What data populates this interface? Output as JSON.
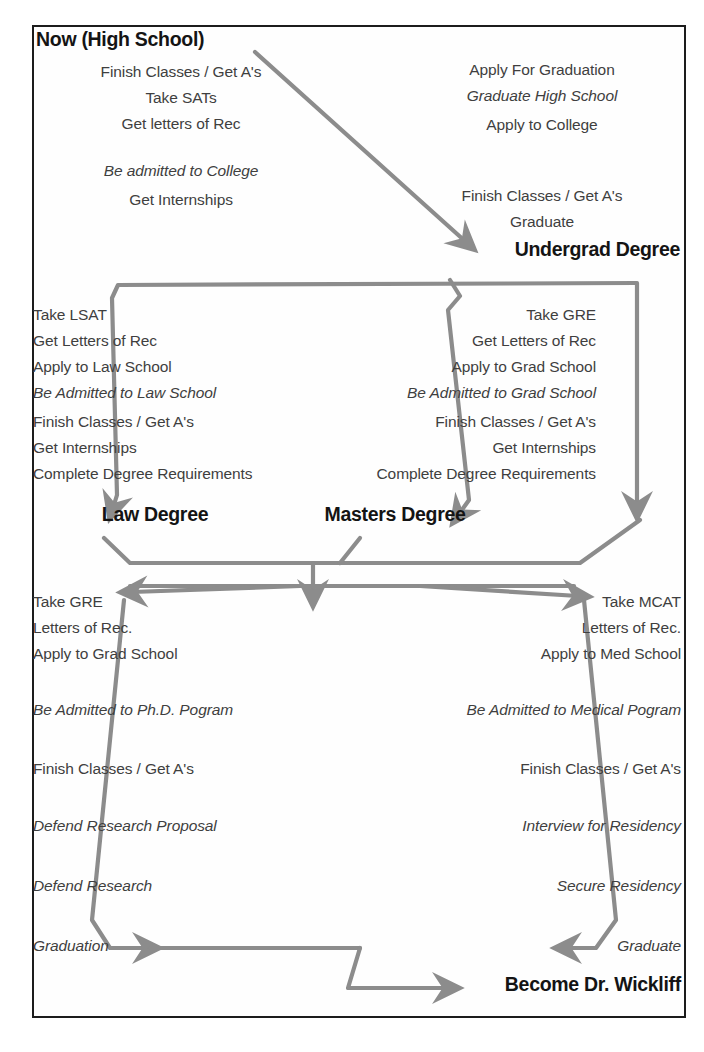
{
  "document": {
    "kind": "career-path-flowchart",
    "final_goal": "Become Dr. Wickliff"
  },
  "colors": {
    "arrow": "#8c8c8c",
    "frame": "#1c1c1c",
    "text": "#3f3f3f",
    "heading": "#141414",
    "background": "#ffffff"
  },
  "nodes": {
    "high_school": {
      "title": "Now (High School)",
      "steps": [
        "Finish Classes / Get A's",
        "Take SATs",
        "Get letters of Rec"
      ],
      "milestone": "Be admitted to College",
      "post_steps": [
        "Get Internships"
      ]
    },
    "college": {
      "steps": [
        "Apply For Graduation"
      ],
      "milestone": "Graduate High School",
      "post_steps": [
        "Apply to College"
      ],
      "degree_steps": [
        "Finish Classes / Get A's",
        "Graduate"
      ],
      "title": "Undergrad Degree"
    },
    "law_school": {
      "steps": [
        "Take LSAT",
        "Get Letters of Rec",
        "Apply to Law School"
      ],
      "milestone": "Be Admitted to Law School",
      "post_steps": [
        "Finish Classes / Get A's",
        "Get Internships",
        "Complete Degree Requirements"
      ],
      "title": "Law Degree"
    },
    "grad_school": {
      "steps": [
        "Take GRE",
        "Get Letters of Rec",
        "Apply to Grad School"
      ],
      "milestone": "Be Admitted to Grad School",
      "post_steps": [
        "Finish Classes / Get A's",
        "Get Internships",
        "Complete Degree Requirements"
      ],
      "title": "Masters Degree"
    },
    "phd": {
      "steps": [
        "Take GRE",
        "Letters of Rec.",
        "Apply to Grad School"
      ],
      "milestone": "Be Admitted to Ph.D. Pogram",
      "mid_steps": [
        "Finish Classes / Get A's"
      ],
      "research_steps": [
        "Defend Research Proposal",
        "Defend Research"
      ],
      "final_step": "Graduation"
    },
    "med_school": {
      "steps": [
        "Take MCAT",
        "Letters of Rec.",
        "Apply to Med School"
      ],
      "milestone": "Be Admitted to Medical Pogram",
      "mid_steps": [
        "Finish Classes / Get A's"
      ],
      "residency_steps": [
        "Interview for Residency",
        "Secure Residency"
      ],
      "final_step": "Graduate"
    },
    "goal": {
      "title": "Become Dr. Wickliff"
    }
  }
}
